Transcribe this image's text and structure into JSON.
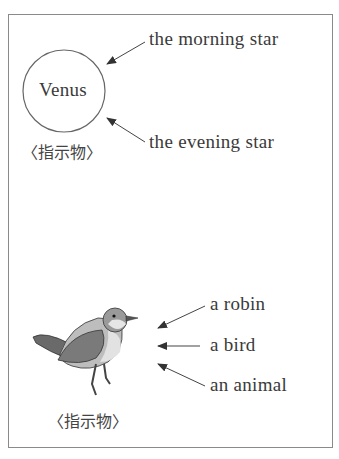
{
  "top_section": {
    "circle_label": "Venus",
    "referent_label": "〈指示物〉",
    "expressions": [
      "the morning star",
      "the evening star"
    ]
  },
  "bottom_section": {
    "image": "robin-bird-illustration",
    "referent_label": "〈指示物〉",
    "expressions": [
      "a robin",
      "a bird",
      "an animal"
    ]
  }
}
